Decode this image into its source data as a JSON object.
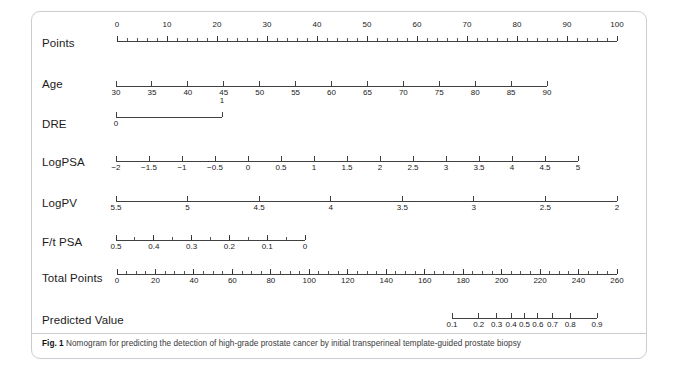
{
  "figure": {
    "caption_bold": "Fig. 1",
    "caption_text": "Nomogram for predicting the detection of high-grade prostate cancer by initial transperineal template-guided prostate biopsy",
    "axis_color": "#2b2b2b",
    "text_color": "#1b1b1b",
    "border_color": "#c9cdd1"
  },
  "chart_data": {
    "type": "nomogram",
    "title": "Nomogram for predicting the detection of high-grade prostate cancer by initial transperineal template-guided prostate biopsy",
    "rows": [
      {
        "label": "Points",
        "labels_above": true,
        "axis_start": 0,
        "axis_end": 100,
        "major_ticks": [
          0,
          10,
          20,
          30,
          40,
          50,
          60,
          70,
          80,
          90,
          100
        ],
        "major_tick_labels": [
          "0",
          "10",
          "20",
          "30",
          "40",
          "50",
          "60",
          "70",
          "80",
          "90",
          "100"
        ],
        "minor_step": 2,
        "reversed": false
      },
      {
        "label": "Age",
        "labels_above": false,
        "axis_start": 30,
        "axis_end": 90,
        "major_ticks": [
          30,
          35,
          40,
          45,
          50,
          55,
          60,
          65,
          70,
          75,
          80,
          85,
          90
        ],
        "major_tick_labels": [
          "30",
          "35",
          "40",
          "45",
          "50",
          "55",
          "60",
          "65",
          "70",
          "75",
          "80",
          "85",
          "90"
        ],
        "minor_step": 0,
        "reversed": false
      },
      {
        "label": "DRE",
        "labels_above": false,
        "axis_start": 0,
        "axis_end": 1,
        "major_ticks": [
          0,
          1
        ],
        "major_tick_labels": [
          "0",
          "1"
        ],
        "tick_label_positions": [
          "below",
          "above"
        ],
        "minor_step": 0,
        "reversed": false
      },
      {
        "label": "LogPSA",
        "labels_above": false,
        "axis_start": -2,
        "axis_end": 5,
        "major_ticks": [
          -2,
          -1.5,
          -1,
          -0.5,
          0,
          0.5,
          1,
          1.5,
          2,
          2.5,
          3,
          3.5,
          4,
          4.5,
          5
        ],
        "major_tick_labels": [
          "−2",
          "−1.5",
          "−1",
          "−0.5",
          "0",
          "0.5",
          "1",
          "1.5",
          "2",
          "2.5",
          "3",
          "3.5",
          "4",
          "4.5",
          "5"
        ],
        "minor_step": 0,
        "reversed": false
      },
      {
        "label": "LogPV",
        "labels_above": false,
        "axis_start": 5.5,
        "axis_end": 2,
        "major_ticks": [
          5.5,
          5,
          4.5,
          4,
          3.5,
          3,
          2.5,
          2
        ],
        "major_tick_labels": [
          "5.5",
          "5",
          "4.5",
          "4",
          "3.5",
          "3",
          "2.5",
          "2"
        ],
        "minor_step": 0,
        "reversed": true
      },
      {
        "label": "F/t PSA",
        "labels_above": false,
        "axis_start": 0.5,
        "axis_end": 0,
        "major_ticks": [
          0.5,
          0.4,
          0.3,
          0.2,
          0.1,
          0
        ],
        "major_tick_labels": [
          "0.5",
          "0.4",
          "0.3",
          "0.2",
          "0.1",
          "0"
        ],
        "minor_step": 0.05,
        "reversed": true
      },
      {
        "label": "Total Points",
        "labels_above": false,
        "axis_start": 0,
        "axis_end": 260,
        "major_ticks": [
          0,
          20,
          40,
          60,
          80,
          100,
          120,
          140,
          160,
          180,
          200,
          220,
          240,
          260
        ],
        "major_tick_labels": [
          "0",
          "20",
          "40",
          "60",
          "80",
          "100",
          "120",
          "140",
          "160",
          "180",
          "200",
          "220",
          "240",
          "260"
        ],
        "minor_step": 5,
        "reversed": false
      },
      {
        "label": "Predicted Value",
        "labels_above": false,
        "scale": "logit",
        "axis_start": 0.1,
        "axis_end": 0.9,
        "major_ticks": [
          0.1,
          0.2,
          0.3,
          0.4,
          0.5,
          0.6,
          0.7,
          0.8,
          0.9
        ],
        "major_tick_labels": [
          "0.1",
          "0.2",
          "0.3",
          "0.4",
          "0.5",
          "0.6",
          "0.7",
          "0.8",
          "0.9"
        ],
        "minor_step": 0,
        "reversed": false
      }
    ]
  }
}
